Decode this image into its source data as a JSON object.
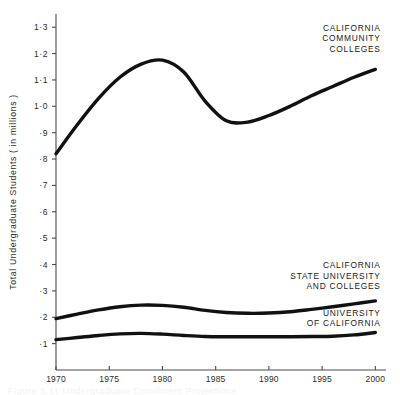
{
  "figure": {
    "background_color": "#ffffff",
    "line_color": "#111111",
    "axis_color": "#4a4a4a",
    "caption_partial": "Figure 5.11  Undergraduate Enrollment Projections"
  },
  "chart_data": {
    "type": "line",
    "title": "",
    "xlabel": "",
    "ylabel": "Total Undergraduate Students  ( in millions )",
    "xlim": [
      1970,
      2001
    ],
    "ylim": [
      0,
      1.35
    ],
    "grid": false,
    "legend_position": "inline-right",
    "x_ticks": [
      1970,
      1975,
      1980,
      1985,
      1990,
      1995,
      2000
    ],
    "x_tick_labels": [
      "1970",
      "1975",
      "1980",
      "1985",
      "1990",
      "1995",
      "2000"
    ],
    "y_ticks": [
      0.1,
      0.2,
      0.3,
      0.4,
      0.5,
      0.6,
      0.7,
      0.8,
      0.9,
      1.0,
      1.1,
      1.2,
      1.3
    ],
    "y_tick_labels": [
      "·1",
      "·2",
      "·3",
      "·4",
      "·5",
      "·6",
      "·7",
      "·8",
      "·9",
      "1·0",
      "1·1",
      "1·2",
      "1·3"
    ],
    "x": [
      1970,
      1972,
      1974,
      1976,
      1978,
      1980,
      1982,
      1984,
      1986,
      1988,
      1990,
      1992,
      1994,
      1996,
      1998,
      2000
    ],
    "series": [
      {
        "name": "CALIFORNIA COMMUNITY COLLEGES",
        "label_lines": [
          "CALIFORNIA",
          "COMMUNITY",
          "COLLEGES"
        ],
        "label_x": 2000.5,
        "label_y": 1.285,
        "values": [
          0.82,
          0.93,
          1.03,
          1.11,
          1.16,
          1.175,
          1.13,
          1.02,
          0.945,
          0.94,
          0.965,
          1.0,
          1.04,
          1.075,
          1.11,
          1.14
        ]
      },
      {
        "name": "CALIFORNIA STATE UNIVERSITY AND COLLEGES",
        "label_lines": [
          "CALIFORNIA",
          "STATE UNIVERSITY",
          "AND COLLEGES"
        ],
        "label_x": 2000.5,
        "label_y": 0.385,
        "values": [
          0.195,
          0.212,
          0.228,
          0.24,
          0.246,
          0.245,
          0.238,
          0.226,
          0.218,
          0.215,
          0.216,
          0.221,
          0.23,
          0.24,
          0.251,
          0.262
        ]
      },
      {
        "name": "UNIVERSITY OF CALIFORNIA",
        "label_lines": [
          "UNIVERSITY",
          "OF CALIFORNIA"
        ],
        "label_x": 2000.5,
        "label_y": 0.205,
        "values": [
          0.115,
          0.123,
          0.131,
          0.137,
          0.139,
          0.136,
          0.131,
          0.127,
          0.126,
          0.126,
          0.126,
          0.126,
          0.127,
          0.128,
          0.133,
          0.142
        ]
      }
    ]
  }
}
